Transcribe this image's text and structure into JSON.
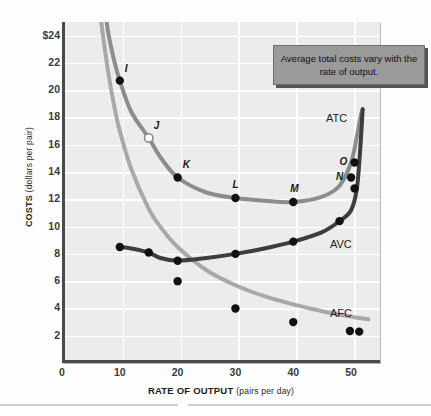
{
  "figure": {
    "callout_text": "Average total costs vary with the rate of output.",
    "colors": {
      "atc": "#8c8c8c",
      "avc": "#3d3d3d",
      "afc": "#a8a8a8",
      "plot_bg": "#ececec",
      "grid": "#ffffff",
      "axis": "#4a4a4a",
      "callout_bg": "#9a9a9a",
      "point": "#111111"
    }
  },
  "chart_data": {
    "type": "line",
    "title": "",
    "xlabel": "RATE OF OUTPUT",
    "xlabel_sub": "(pairs per day)",
    "ylabel": "COSTS",
    "ylabel_sub": "(dollars per pair)",
    "xlim": [
      0,
      55
    ],
    "ylim": [
      0,
      25
    ],
    "xticks": [
      0,
      10,
      20,
      30,
      40,
      50
    ],
    "xticklabels": [
      "0",
      "10",
      "20",
      "30",
      "40",
      "50"
    ],
    "yticks": [
      2,
      4,
      6,
      8,
      10,
      12,
      14,
      16,
      18,
      20,
      22,
      24
    ],
    "yticklabels": [
      "2",
      "4",
      "6",
      "8",
      "10",
      "12",
      "14",
      "16",
      "18",
      "20",
      "22",
      "$24"
    ],
    "grid": true,
    "legend": "inline-curve-labels",
    "series": [
      {
        "name": "ATC",
        "label": "ATC",
        "color": "#8c8c8c",
        "x": [
          7.6,
          8,
          9,
          10,
          12,
          15,
          17,
          20,
          25,
          30,
          35,
          40,
          45,
          48,
          50,
          51,
          51.6,
          52
        ],
        "values": [
          25.5,
          24.2,
          22.2,
          20.7,
          18.4,
          16.5,
          15.1,
          13.6,
          12.5,
          12.1,
          11.9,
          11.8,
          12.2,
          13.0,
          14.7,
          16.6,
          18.0,
          18.6
        ]
      },
      {
        "name": "AVC",
        "label": "AVC",
        "color": "#3d3d3d",
        "x": [
          10,
          12,
          15,
          17,
          20,
          25,
          30,
          35,
          40,
          45,
          48,
          50,
          51,
          51.6,
          52
        ],
        "values": [
          8.5,
          8.4,
          8.1,
          7.7,
          7.5,
          7.7,
          8.0,
          8.4,
          8.9,
          9.6,
          10.4,
          11.2,
          12.8,
          15.8,
          18.6
        ]
      },
      {
        "name": "AFC",
        "label": "AFC",
        "color": "#a8a8a8",
        "x": [
          6.7,
          7,
          8,
          9,
          10,
          12,
          15,
          17,
          20,
          25,
          30,
          35,
          40,
          45,
          50,
          51.5,
          53
        ],
        "values": [
          25.5,
          24.3,
          21.3,
          18.9,
          17.0,
          14.2,
          11.3,
          10.0,
          8.5,
          6.8,
          5.7,
          4.9,
          4.3,
          3.8,
          3.4,
          3.3,
          3.2
        ]
      }
    ],
    "data_points": [
      {
        "label": "I",
        "series": "ATC",
        "x": 10,
        "y": 20.7,
        "filled": true,
        "label_pos": "above-right"
      },
      {
        "label": "J",
        "series": "ATC",
        "x": 15,
        "y": 16.5,
        "filled": false,
        "label_pos": "above-right"
      },
      {
        "label": "K",
        "series": "ATC",
        "x": 20,
        "y": 13.6,
        "filled": true,
        "label_pos": "above-right"
      },
      {
        "label": "L",
        "series": "ATC",
        "x": 30,
        "y": 12.1,
        "filled": true,
        "label_pos": "above"
      },
      {
        "label": "M",
        "series": "ATC",
        "x": 40,
        "y": 11.8,
        "filled": true,
        "label_pos": "above"
      },
      {
        "label": "N",
        "series": "ATC",
        "x": 50,
        "y": 13.6,
        "filled": true,
        "label_pos": "left"
      },
      {
        "label": "O",
        "series": "ATC",
        "x": 50.6,
        "y": 14.7,
        "filled": true,
        "label_pos": "left"
      },
      {
        "label": "",
        "series": "AVC",
        "x": 10,
        "y": 8.5,
        "filled": true
      },
      {
        "label": "",
        "series": "AVC",
        "x": 15,
        "y": 8.1,
        "filled": true
      },
      {
        "label": "",
        "series": "AVC",
        "x": 20,
        "y": 7.5,
        "filled": true
      },
      {
        "label": "",
        "series": "AVC",
        "x": 30,
        "y": 8.0,
        "filled": true
      },
      {
        "label": "",
        "series": "AVC",
        "x": 40,
        "y": 8.9,
        "filled": true
      },
      {
        "label": "",
        "series": "AVC",
        "x": 48,
        "y": 10.4,
        "filled": true
      },
      {
        "label": "",
        "series": "AVC",
        "x": 50.6,
        "y": 12.8,
        "filled": true
      },
      {
        "label": "",
        "series": "AFC",
        "x": 20,
        "y": 6.0,
        "filled": true
      },
      {
        "label": "",
        "series": "AFC",
        "x": 30,
        "y": 4.0,
        "filled": true
      },
      {
        "label": "",
        "series": "AFC",
        "x": 40,
        "y": 3.0,
        "filled": true
      },
      {
        "label": "",
        "series": "AFC",
        "x": 49.8,
        "y": 2.35,
        "filled": true
      },
      {
        "label": "",
        "series": "AFC",
        "x": 51.4,
        "y": 2.3,
        "filled": true
      }
    ]
  }
}
